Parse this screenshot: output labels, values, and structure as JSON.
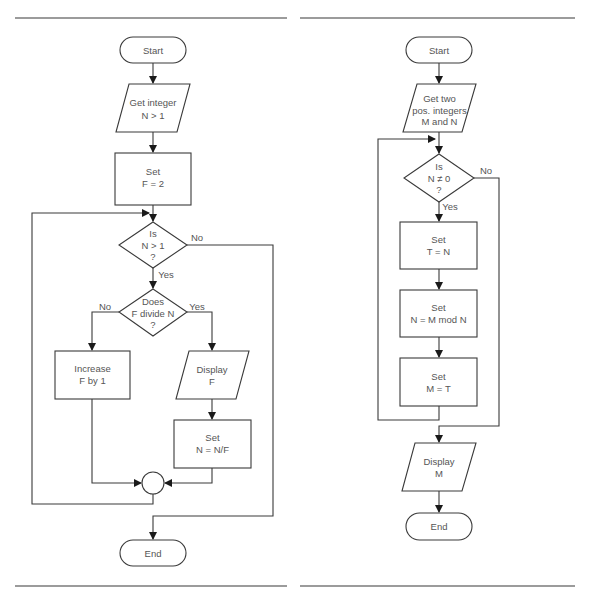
{
  "colors": {
    "line": "#3a3a3a",
    "text": "#555555",
    "rule": "#7a7a7a",
    "background": "#ffffff"
  },
  "left_flowchart": {
    "start": "Start",
    "input": [
      "Get integer",
      "N > 1"
    ],
    "init": [
      "Set",
      "F = 2"
    ],
    "decision1": [
      "Is",
      "N > 1",
      "?"
    ],
    "decision1_no": "No",
    "decision1_yes": "Yes",
    "decision2": [
      "Does",
      "F divide N",
      "?"
    ],
    "decision2_no": "No",
    "decision2_yes": "Yes",
    "increase": [
      "Increase",
      "F by 1"
    ],
    "display": [
      "Display",
      "F"
    ],
    "divide": [
      "Set",
      "N = N/F"
    ],
    "end": "End"
  },
  "right_flowchart": {
    "start": "Start",
    "input": [
      "Get two",
      "pos. integers",
      "M and N"
    ],
    "decision": [
      "Is",
      "N ≠ 0",
      "?"
    ],
    "decision_no": "No",
    "decision_yes": "Yes",
    "step1": [
      "Set",
      "T = N"
    ],
    "step2": [
      "Set",
      "N = M mod N"
    ],
    "step3": [
      "Set",
      "M = T"
    ],
    "display": [
      "Display",
      "M"
    ],
    "end": "End"
  }
}
